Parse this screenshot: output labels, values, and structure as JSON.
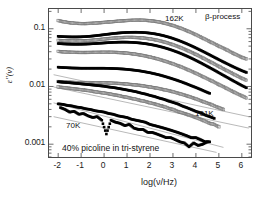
{
  "figure": {
    "caption_in_plot": "40% picoline in tri-styrene",
    "background": "#ffffff",
    "frame_color": "#4a4a4a"
  },
  "chart_data": {
    "type": "scatter",
    "title": "",
    "xlabel": "log(ν/Hz)",
    "ylabel": "ε\"(ν)",
    "yscale": "log",
    "xlim": [
      -2.4,
      6.4
    ],
    "ylim": [
      0.0006,
      0.22
    ],
    "xticks": [
      "-2",
      "-1",
      "0",
      "1",
      "2",
      "3",
      "4",
      "5",
      "6"
    ],
    "xtick_values": [
      -2,
      -1,
      0,
      1,
      2,
      3,
      4,
      5,
      6
    ],
    "yticks": [
      "0.1",
      "0.01",
      "0.001"
    ],
    "ytick_values": [
      0.1,
      0.01,
      0.001
    ],
    "grid": false,
    "legend": "none",
    "annotations": [
      {
        "text": "162K",
        "x": 1.6,
        "y": 0.145
      },
      {
        "text": "β-process",
        "x": 3.6,
        "y": 0.165
      },
      {
        "text": "101K",
        "x": 4.4,
        "y": 0.0035
      },
      {
        "text": "70K",
        "x": -1.4,
        "y": 0.0022
      },
      {
        "text": "40% picoline in tri-styrene",
        "x": -1.8,
        "y": 0.00098
      }
    ],
    "symbol_size_px": 2.6,
    "series": [
      {
        "name": "162K",
        "temperature_K": 162,
        "marker": "open-square",
        "color": "#7a7a7a",
        "x": [
          -2.0,
          -1.8,
          -1.6,
          -1.4,
          -1.2,
          -1.0,
          -0.8,
          -0.6,
          -0.4,
          -0.2,
          0.0,
          0.2,
          0.4,
          0.6,
          0.8,
          1.0,
          1.2,
          1.4,
          1.6,
          1.8,
          2.0,
          2.2,
          2.4,
          2.6,
          2.8,
          3.0,
          3.2,
          3.4,
          3.6,
          3.8,
          4.0,
          4.2,
          4.4,
          4.6,
          4.8,
          5.0,
          5.2,
          5.4,
          5.6,
          5.8,
          6.0,
          6.2
        ],
        "y": [
          0.139,
          0.133,
          0.129,
          0.126,
          0.124,
          0.123,
          0.123,
          0.124,
          0.125,
          0.127,
          0.129,
          0.131,
          0.133,
          0.135,
          0.137,
          0.139,
          0.14,
          0.141,
          0.141,
          0.14,
          0.138,
          0.135,
          0.131,
          0.126,
          0.12,
          0.114,
          0.107,
          0.1,
          0.093,
          0.086,
          0.079,
          0.072,
          0.066,
          0.06,
          0.055,
          0.05,
          0.046,
          0.042,
          0.038,
          0.035,
          0.032,
          0.03
        ]
      },
      {
        "name": "155K",
        "temperature_K": 155,
        "marker": "filled-square",
        "color": "#000000",
        "x": [
          -2.0,
          -1.8,
          -1.6,
          -1.4,
          -1.2,
          -1.0,
          -0.8,
          -0.6,
          -0.4,
          -0.2,
          0.0,
          0.2,
          0.4,
          0.6,
          0.8,
          1.0,
          1.2,
          1.4,
          1.6,
          1.8,
          2.0,
          2.2,
          2.4,
          2.6,
          2.8,
          3.0,
          3.2,
          3.4,
          3.6,
          3.8,
          4.0,
          4.2,
          4.4,
          4.6,
          4.8,
          5.0,
          5.2,
          5.4,
          5.6,
          5.8,
          6.0,
          6.2
        ],
        "y": [
          0.074,
          0.073,
          0.0725,
          0.0722,
          0.0722,
          0.0725,
          0.0732,
          0.0742,
          0.0756,
          0.0772,
          0.079,
          0.0808,
          0.0826,
          0.0842,
          0.0855,
          0.0864,
          0.0869,
          0.087,
          0.0866,
          0.0856,
          0.084,
          0.0818,
          0.079,
          0.0757,
          0.072,
          0.068,
          0.0637,
          0.0594,
          0.055,
          0.0507,
          0.0465,
          0.0425,
          0.0388,
          0.0353,
          0.0321,
          0.0292,
          0.0266,
          0.0243,
          0.0222,
          0.0204,
          0.0188,
          0.0175
        ]
      },
      {
        "name": "148K",
        "temperature_K": 148,
        "marker": "open-square",
        "color": "#7a7a7a",
        "x": [
          -2.0,
          -1.8,
          -1.6,
          -1.4,
          -1.2,
          -1.0,
          -0.8,
          -0.6,
          -0.4,
          -0.2,
          0.0,
          0.2,
          0.4,
          0.6,
          0.8,
          1.0,
          1.2,
          1.4,
          1.6,
          1.8,
          2.0,
          2.2,
          2.4,
          2.6,
          2.8,
          3.0,
          3.2,
          3.4,
          3.6,
          3.8,
          4.0,
          4.2,
          4.4,
          4.6,
          4.8,
          5.0,
          5.2,
          5.4,
          5.6,
          5.8,
          6.0,
          6.2
        ],
        "y": [
          0.063,
          0.0622,
          0.0617,
          0.0614,
          0.0613,
          0.0615,
          0.062,
          0.0628,
          0.0638,
          0.065,
          0.0663,
          0.0676,
          0.0688,
          0.0698,
          0.0705,
          0.0709,
          0.0709,
          0.0705,
          0.0697,
          0.0685,
          0.0668,
          0.0647,
          0.0622,
          0.0594,
          0.0563,
          0.053,
          0.0496,
          0.0461,
          0.0426,
          0.0392,
          0.0359,
          0.0328,
          0.0298,
          0.0271,
          0.0246,
          0.0223,
          0.0202,
          0.0184,
          0.0167,
          0.0152,
          0.0139,
          0.0128
        ]
      },
      {
        "name": "141K",
        "temperature_K": 141,
        "marker": "filled-square",
        "color": "#000000",
        "x": [
          -2.0,
          -1.8,
          -1.6,
          -1.4,
          -1.2,
          -1.0,
          -0.8,
          -0.6,
          -0.4,
          -0.2,
          0.0,
          0.2,
          0.4,
          0.6,
          0.8,
          1.0,
          1.2,
          1.4,
          1.6,
          1.8,
          2.0,
          2.2,
          2.4,
          2.6,
          2.8,
          3.0,
          3.2,
          3.4,
          3.6,
          3.8,
          4.0,
          4.2,
          4.4,
          4.6,
          4.8,
          5.0,
          5.2,
          5.4,
          5.6,
          5.8,
          6.0,
          6.2
        ],
        "y": [
          0.0555,
          0.0548,
          0.0543,
          0.054,
          0.0539,
          0.054,
          0.0543,
          0.0548,
          0.0554,
          0.0561,
          0.0568,
          0.0575,
          0.0581,
          0.0585,
          0.0587,
          0.0586,
          0.0582,
          0.0575,
          0.0565,
          0.0552,
          0.0536,
          0.0517,
          0.0496,
          0.0472,
          0.0447,
          0.042,
          0.0393,
          0.0365,
          0.0337,
          0.031,
          0.0283,
          0.0258,
          0.0234,
          0.0212,
          0.0192,
          0.0173,
          0.0156,
          0.0141,
          0.0127,
          0.0115,
          0.0104,
          0.0095
        ]
      },
      {
        "name": "134K",
        "temperature_K": 134,
        "marker": "open-square",
        "color": "#7a7a7a",
        "x": [
          -2.0,
          -1.8,
          -1.6,
          -1.4,
          -1.2,
          -1.0,
          -0.8,
          -0.6,
          -0.4,
          -0.2,
          0.0,
          0.2,
          0.4,
          0.6,
          0.8,
          1.0,
          1.2,
          1.4,
          1.6,
          1.8,
          2.0,
          2.2,
          2.4,
          2.6,
          2.8,
          3.0,
          3.2,
          3.4,
          3.6,
          3.8,
          4.0,
          4.2,
          4.4,
          4.6,
          4.8,
          5.0,
          5.2,
          5.4,
          5.6,
          5.8,
          6.0,
          6.2
        ],
        "y": [
          0.0405,
          0.0399,
          0.0394,
          0.0391,
          0.0389,
          0.0388,
          0.0388,
          0.0389,
          0.039,
          0.0391,
          0.0392,
          0.0392,
          0.0391,
          0.0388,
          0.0384,
          0.0378,
          0.037,
          0.0361,
          0.035,
          0.0338,
          0.0324,
          0.031,
          0.0295,
          0.0279,
          0.0263,
          0.0247,
          0.0231,
          0.0215,
          0.0199,
          0.0184,
          0.0169,
          0.0155,
          0.0142,
          0.013,
          0.0119,
          0.0108,
          0.0099,
          0.009,
          0.0082,
          0.0075,
          0.0069,
          0.0063
        ]
      },
      {
        "name": "127K",
        "temperature_K": 127,
        "marker": "filled-square",
        "color": "#000000",
        "x": [
          -2.0,
          -1.8,
          -1.6,
          -1.4,
          -1.2,
          -1.0,
          -0.8,
          -0.6,
          -0.4,
          -0.2,
          0.0,
          0.2,
          0.4,
          0.6,
          0.8,
          1.0,
          1.2,
          1.4,
          1.6,
          1.8,
          2.0,
          2.2,
          2.4,
          2.6,
          2.8,
          3.0,
          3.2,
          3.4,
          3.6,
          3.8,
          4.0,
          4.2,
          4.4,
          4.6
        ],
        "y": [
          0.0216,
          0.0213,
          0.0211,
          0.0209,
          0.0208,
          0.0207,
          0.0207,
          0.0207,
          0.0207,
          0.0207,
          0.0207,
          0.0206,
          0.0205,
          0.0203,
          0.0201,
          0.0198,
          0.0194,
          0.019,
          0.0185,
          0.0179,
          0.0173,
          0.0166,
          0.0159,
          0.0151,
          0.0143,
          0.0135,
          0.0127,
          0.0119,
          0.0111,
          0.0103,
          0.0096,
          0.0089,
          0.0082,
          0.0076
        ]
      },
      {
        "name": "120K",
        "temperature_K": 120,
        "marker": "open-square",
        "color": "#7a7a7a",
        "x": [
          -2.0,
          -1.8,
          -1.6,
          -1.4,
          -1.2,
          -1.0,
          -0.8,
          -0.6,
          -0.4,
          -0.2,
          0.0,
          0.2,
          0.4,
          0.6,
          0.8,
          1.0,
          1.2,
          1.4,
          1.6,
          1.8,
          2.0,
          2.2,
          2.4,
          2.6,
          2.8,
          3.0,
          3.2,
          3.4,
          3.6,
          3.8,
          4.0,
          4.2,
          4.4,
          4.6,
          4.8,
          5.0,
          5.2
        ],
        "y": [
          0.0122,
          0.012,
          0.0119,
          0.0118,
          0.0117,
          0.0117,
          0.0117,
          0.0117,
          0.0116,
          0.0116,
          0.0116,
          0.0115,
          0.0114,
          0.0113,
          0.0112,
          0.011,
          0.0108,
          0.0106,
          0.0104,
          0.0101,
          0.0098,
          0.0095,
          0.0092,
          0.0088,
          0.0085,
          0.0081,
          0.0077,
          0.0073,
          0.0069,
          0.0065,
          0.0061,
          0.0057,
          0.0053,
          0.005,
          0.0046,
          0.0043,
          0.004
        ]
      },
      {
        "name": "113K",
        "temperature_K": 113,
        "marker": "filled-square",
        "color": "#000000",
        "x": [
          -2.0,
          -1.8,
          -1.6,
          -1.4,
          -1.2,
          -1.0,
          -0.8,
          -0.6,
          -0.4,
          -0.2,
          0.0,
          0.2,
          0.4,
          0.6,
          0.8,
          1.0,
          1.2,
          1.4,
          1.6,
          1.8,
          2.0,
          2.2,
          2.4,
          2.6,
          2.8,
          3.0,
          3.2,
          3.4,
          3.6,
          3.8,
          4.0,
          4.2,
          4.4,
          4.6,
          4.8
        ],
        "y": [
          0.0121,
          0.0119,
          0.0117,
          0.0115,
          0.0113,
          0.0111,
          0.0109,
          0.0107,
          0.0105,
          0.0103,
          0.0101,
          0.0098,
          0.0096,
          0.0093,
          0.009,
          0.0087,
          0.0084,
          0.0081,
          0.0077,
          0.0074,
          0.007,
          0.0067,
          0.0063,
          0.006,
          0.0056,
          0.0053,
          0.005,
          0.0046,
          0.0043,
          0.004,
          0.0037,
          0.0035,
          0.0032,
          0.003,
          0.0028
        ]
      },
      {
        "name": "107K",
        "temperature_K": 107,
        "marker": "open-square",
        "color": "#7a7a7a",
        "x": [
          -2.0,
          -1.8,
          -1.6,
          -1.4,
          -1.2,
          -1.0,
          -0.8,
          -0.6,
          -0.4,
          -0.2,
          0.0,
          0.2,
          0.4,
          0.6,
          0.8,
          1.0,
          1.2,
          1.4,
          1.6,
          1.8,
          2.0,
          2.2,
          2.4,
          2.6,
          2.8,
          3.0,
          3.2,
          3.4,
          3.6,
          3.8,
          4.0,
          4.2,
          4.4,
          4.6,
          4.8,
          5.0
        ],
        "y": [
          0.0098,
          0.0096,
          0.0094,
          0.0092,
          0.009,
          0.0088,
          0.0086,
          0.0084,
          0.0081,
          0.0079,
          0.0077,
          0.0075,
          0.0072,
          0.007,
          0.0067,
          0.0065,
          0.0062,
          0.006,
          0.0057,
          0.0055,
          0.0052,
          0.005,
          0.0047,
          0.0045,
          0.0042,
          0.004,
          0.0037,
          0.0035,
          0.0033,
          0.0031,
          0.0029,
          0.0027,
          0.0025,
          0.0023,
          0.0022,
          0.002
        ]
      },
      {
        "name": "101K",
        "temperature_K": 101,
        "marker": "filled-square",
        "color": "#000000",
        "x": [
          -2.0,
          -1.8,
          -1.6,
          -1.4,
          -1.2,
          -1.0,
          -0.8,
          -0.6,
          -0.4,
          -0.2,
          0.0,
          0.2,
          0.4,
          0.6,
          0.8,
          1.0,
          1.2,
          1.4,
          1.6,
          1.8,
          2.0,
          2.2,
          2.4,
          2.6,
          2.8,
          3.0,
          3.2,
          3.4,
          3.6,
          3.8,
          4.0,
          4.2,
          4.4,
          4.6
        ],
        "y": [
          0.005,
          0.0049,
          0.0047,
          0.0046,
          0.0044,
          0.0043,
          0.0041,
          0.004,
          0.0038,
          0.0037,
          0.0036,
          0.0034,
          0.0033,
          0.0031,
          0.003,
          0.0029,
          0.0027,
          0.0026,
          0.0025,
          0.0024,
          0.0022,
          0.0021,
          0.002,
          0.0019,
          0.0018,
          0.0017,
          0.0016,
          0.0015,
          0.0014,
          0.0013,
          0.0013,
          0.0012,
          0.0011,
          0.0011
        ]
      },
      {
        "name": "70K",
        "temperature_K": 70,
        "marker": "filled-square",
        "color": "#000000",
        "x": [
          -1.9,
          -1.7,
          -1.5,
          -1.3,
          -1.1,
          -0.9,
          -0.7,
          -0.5,
          -0.3,
          -0.1,
          0.1,
          0.3,
          0.5,
          0.7,
          0.9,
          1.1,
          1.3,
          1.5,
          1.7,
          1.9,
          2.1,
          2.3,
          2.5,
          2.7,
          2.9,
          3.1,
          3.3,
          3.5,
          3.7,
          3.9,
          4.1,
          4.3,
          4.5
        ],
        "y": [
          0.0043,
          0.004,
          0.0036,
          0.0037,
          0.0033,
          0.0034,
          0.0031,
          0.0029,
          0.003,
          0.0026,
          0.0015,
          0.0026,
          0.0024,
          0.0023,
          0.0021,
          0.0022,
          0.0019,
          0.0018,
          0.0018,
          0.0016,
          0.0016,
          0.0015,
          0.0014,
          0.0013,
          0.0013,
          0.0012,
          0.0011,
          0.00105,
          0.0009,
          0.00105,
          0.00095,
          0.001,
          0.0011
        ]
      }
    ],
    "guide_lines": [
      {
        "x0": -2.2,
        "y0": 0.016,
        "x1": 6.3,
        "y1": 0.003
      },
      {
        "x0": -2.2,
        "y0": 0.0098,
        "x1": 6.3,
        "y1": 0.0019
      },
      {
        "x0": -2.2,
        "y0": 0.0052,
        "x1": 5.2,
        "y1": 0.00088
      },
      {
        "x0": -2.2,
        "y0": 0.003,
        "x1": 4.9,
        "y1": 0.00072
      }
    ]
  }
}
